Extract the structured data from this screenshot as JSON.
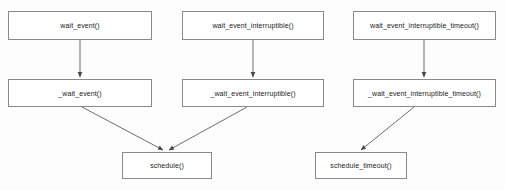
{
  "diagram": {
    "type": "flowchart",
    "title": "",
    "background_color": "#fdfdfd",
    "node_fill_color": "#ffffff",
    "node_border_color": "#8a8a8a",
    "edge_color": "#6e6e6e",
    "text_color": "#1a1a1a",
    "nodes": [
      {
        "id": "wait_event",
        "label": "wait_event()",
        "x": 8,
        "y": 11,
        "w": 144,
        "h": 29,
        "row": 1,
        "column": 1
      },
      {
        "id": "wait_event_interruptible",
        "label": "wait_event_interruptible()",
        "x": 182,
        "y": 11,
        "w": 142,
        "h": 29,
        "row": 1,
        "column": 2
      },
      {
        "id": "wait_event_interruptible_timeout",
        "label": "wait_event_interruptible_timeout()",
        "x": 353,
        "y": 11,
        "w": 143,
        "h": 29,
        "row": 1,
        "column": 3
      },
      {
        "id": "_wait_event",
        "label": "_wait_event()",
        "x": 8,
        "y": 79,
        "w": 144,
        "h": 28,
        "row": 2,
        "column": 1
      },
      {
        "id": "_wait_event_interruptible",
        "label": "_wait_event_interruptible()",
        "x": 182,
        "y": 79,
        "w": 142,
        "h": 28,
        "row": 2,
        "column": 2
      },
      {
        "id": "_wait_event_interruptible_timeout",
        "label": "_wait_event_interruptible_timeout()",
        "x": 353,
        "y": 79,
        "w": 143,
        "h": 28,
        "row": 2,
        "column": 3
      },
      {
        "id": "schedule",
        "label": "schedule()",
        "x": 122,
        "y": 152,
        "w": 90,
        "h": 27,
        "row": 3,
        "column": 1
      },
      {
        "id": "schedule_timeout",
        "label": "schedule_timeout()",
        "x": 315,
        "y": 152,
        "w": 92,
        "h": 27,
        "row": 3,
        "column": 2
      }
    ],
    "edges": [
      {
        "id": "edge-wait-event-to-underscore",
        "from": "wait_event",
        "to": "_wait_event",
        "kind": "vertical-arrow",
        "x1": 80,
        "y1": 40,
        "x2": 80,
        "y2": 78
      },
      {
        "id": "edge-wait-event-interruptible-to-underscore",
        "from": "wait_event_interruptible",
        "to": "_wait_event_interruptible",
        "kind": "vertical-arrow",
        "x1": 253,
        "y1": 40,
        "x2": 253,
        "y2": 78
      },
      {
        "id": "edge-wait-event-interruptible-timeout-to-underscore",
        "from": "wait_event_interruptible_timeout",
        "to": "_wait_event_interruptible_timeout",
        "kind": "vertical-arrow",
        "x1": 424,
        "y1": 40,
        "x2": 424,
        "y2": 78
      },
      {
        "id": "edge-underscore-wait-event-to-schedule",
        "from": "_wait_event",
        "to": "schedule",
        "kind": "diagonal-arrow",
        "x1": 82,
        "y1": 107,
        "x2": 163,
        "y2": 151
      },
      {
        "id": "edge-underscore-interruptible-to-schedule",
        "from": "_wait_event_interruptible",
        "to": "schedule",
        "kind": "diagonal-arrow",
        "x1": 247,
        "y1": 107,
        "x2": 169,
        "y2": 151
      },
      {
        "id": "edge-underscore-interruptible-timeout-to-schedule-timeout",
        "from": "_wait_event_interruptible_timeout",
        "to": "schedule_timeout",
        "kind": "diagonal-arrow",
        "x1": 414,
        "y1": 107,
        "x2": 361,
        "y2": 151
      }
    ]
  }
}
